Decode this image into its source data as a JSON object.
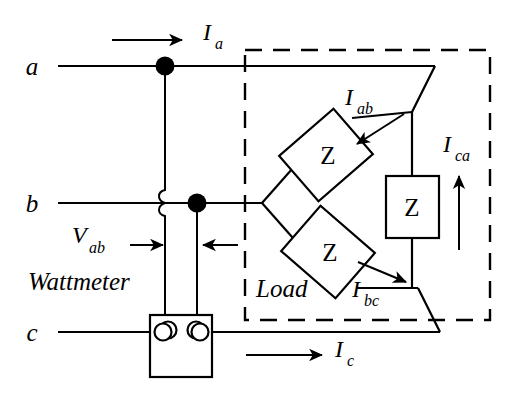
{
  "figure": {
    "kind": "circuit-diagram",
    "stroke_color": "#000000",
    "background_color": "#ffffff"
  },
  "terminals": [
    {
      "id": "a",
      "label": "a",
      "x": 40,
      "y": 66
    },
    {
      "id": "b",
      "label": "b",
      "x": 40,
      "y": 203
    },
    {
      "id": "c",
      "label": "c",
      "x": 40,
      "y": 332
    }
  ],
  "currents": [
    {
      "id": "Ia",
      "base": "I",
      "sub": "a",
      "direction": "right"
    },
    {
      "id": "Ic",
      "base": "I",
      "sub": "c",
      "direction": "right"
    },
    {
      "id": "Iab",
      "base": "I",
      "sub": "ab",
      "direction": "down-left"
    },
    {
      "id": "Ibc",
      "base": "I",
      "sub": "bc",
      "direction": "down-right"
    },
    {
      "id": "Ica",
      "base": "I",
      "sub": "ca",
      "direction": "up"
    }
  ],
  "voltage": {
    "id": "Vab",
    "base": "V",
    "sub": "ab",
    "direction": "right"
  },
  "components": {
    "wattmeter_label": "Wattmeter",
    "load_label": "Load",
    "impedance_label": "Z",
    "impedance_count": 3
  },
  "annotations": {
    "dashed_box_label": "Load",
    "wattmeter_terminal_count": 4
  }
}
